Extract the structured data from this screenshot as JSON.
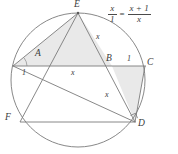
{
  "figure": {
    "type": "geometry-diagram",
    "width": 178,
    "height": 154,
    "background_color": "#ffffff",
    "stroke_color": "#6e6e6e",
    "shade_color": "#e8e8e8",
    "text_color": "#3a3a3a"
  },
  "circle": {
    "center_x": 78,
    "center_y": 80,
    "radius": 67
  },
  "points": [
    {
      "id": "E",
      "label": "E",
      "x": 78,
      "y": 13,
      "label_x": 74,
      "label_y": 1
    },
    {
      "id": "A",
      "label": "A",
      "x": 44,
      "y": 66,
      "label_x": 35,
      "label_y": 50
    },
    {
      "id": "B",
      "label": "B",
      "x": 112,
      "y": 66,
      "label_x": 107,
      "label_y": 54
    },
    {
      "id": "C",
      "label": "C",
      "x": 145,
      "y": 66,
      "label_x": 147,
      "label_y": 58
    },
    {
      "id": "D",
      "label": "D",
      "x": 135,
      "y": 122,
      "label_x": 138,
      "label_y": 120
    },
    {
      "id": "F",
      "label": "F",
      "x": 20,
      "y": 122,
      "label_x": 6,
      "label_y": 114
    },
    {
      "id": "G",
      "label": "",
      "x": 13,
      "y": 66,
      "label_x": 0,
      "label_y": 0
    }
  ],
  "segment_labels": [
    {
      "id": "left-unit",
      "text": "1",
      "x": 22,
      "y": 70
    },
    {
      "id": "mid-x",
      "text": "x",
      "x": 72,
      "y": 70
    },
    {
      "id": "right-unit",
      "text": "1",
      "x": 127,
      "y": 56
    },
    {
      "id": "upper-x",
      "text": "x",
      "x": 96,
      "y": 34
    },
    {
      "id": "lower-x",
      "text": "x",
      "x": 105,
      "y": 92
    }
  ],
  "equation": {
    "left": {
      "numerator": "x",
      "denominator": "1"
    },
    "operator": "=",
    "right": {
      "numerator": "x + 1",
      "denominator": "x"
    },
    "plain": "x/1 = (x+1)/x"
  },
  "shaded_regions": [
    {
      "id": "triangle-E-G-B",
      "vertices": "E, G, B"
    },
    {
      "id": "triangle-B-C-D",
      "vertices": "B, C, D"
    }
  ],
  "right_angle_marker": {
    "at_point": "D",
    "size": 6
  }
}
